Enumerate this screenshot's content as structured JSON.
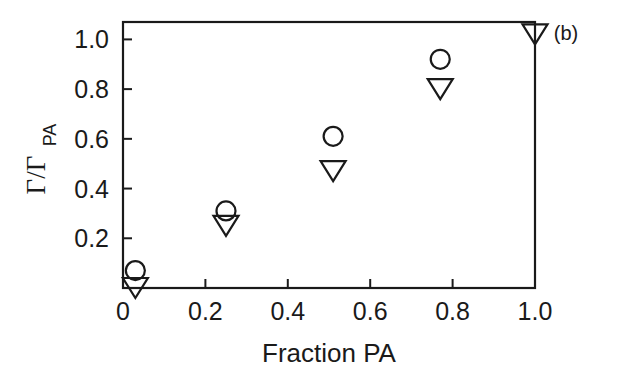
{
  "panel": {
    "label": "(b)"
  },
  "chart_data": {
    "type": "scatter",
    "title": "",
    "subtitle": "",
    "xlabel": "Fraction PA",
    "ylabel": "Γ/Γ",
    "ylabel_main": "Γ/Γ",
    "ylabel_subscript": "PA",
    "xlim": [
      0,
      1.0
    ],
    "ylim": [
      0,
      1.07
    ],
    "grid": false,
    "legend": "none",
    "xticks": [
      0,
      0.2,
      0.4,
      0.6,
      0.8,
      1.0
    ],
    "xtick_labels": [
      "0",
      "0.2",
      "0.4",
      "0.6",
      "0.8",
      "1.0"
    ],
    "yticks": [
      0.2,
      0.4,
      0.6,
      0.8,
      1.0
    ],
    "ytick_labels": [
      "0.2",
      "0.4",
      "0.6",
      "0.8",
      "1.0"
    ],
    "series": [
      {
        "name": "open-circle",
        "marker": "circle-open",
        "color": "#1a1a1a",
        "points": [
          {
            "x": 0.03,
            "y": 0.07
          },
          {
            "x": 0.25,
            "y": 0.31
          },
          {
            "x": 0.51,
            "y": 0.61
          },
          {
            "x": 0.77,
            "y": 0.92
          }
        ]
      },
      {
        "name": "open-down-triangle",
        "marker": "triangle-down-open",
        "color": "#1a1a1a",
        "points": [
          {
            "x": 0.03,
            "y": 0.0
          },
          {
            "x": 0.25,
            "y": 0.25
          },
          {
            "x": 0.51,
            "y": 0.47
          },
          {
            "x": 0.77,
            "y": 0.8
          },
          {
            "x": 1.0,
            "y": 1.02
          }
        ]
      }
    ]
  }
}
